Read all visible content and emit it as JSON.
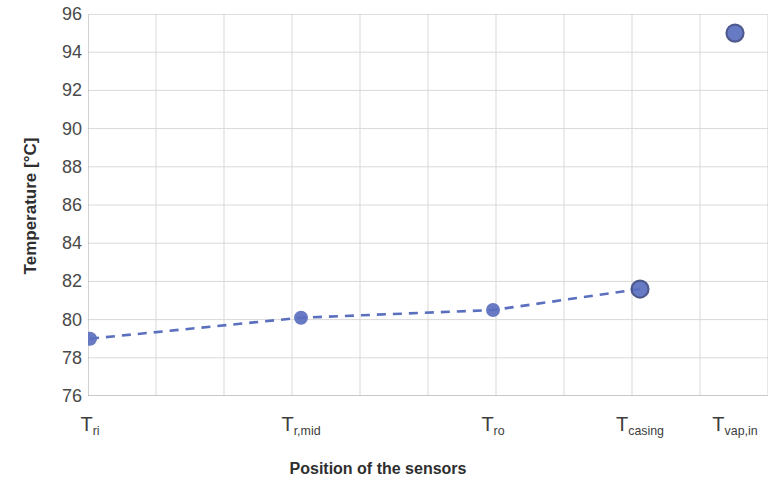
{
  "chart_data": {
    "type": "scatter",
    "title": "",
    "xlabel": "Position of the sensors",
    "ylabel": "Temperature [°C]",
    "categories": [
      "T_ri",
      "T_r,mid",
      "T_ro",
      "T_casing",
      "T_vap,in"
    ],
    "category_labels": [
      {
        "base": "T",
        "sub": "ri"
      },
      {
        "base": "T",
        "sub": "r,mid"
      },
      {
        "base": "T",
        "sub": "ro"
      },
      {
        "base": "T",
        "sub": "casing"
      },
      {
        "base": "T",
        "sub": "vap,in"
      }
    ],
    "values": [
      79.0,
      80.1,
      80.5,
      81.6,
      95.0
    ],
    "ylim": [
      76,
      96
    ],
    "yticks": [
      96,
      94,
      92,
      90,
      88,
      86,
      84,
      82,
      80,
      78,
      76
    ],
    "ytick_labels": [
      "96",
      "94",
      "92",
      "90",
      "88",
      "86",
      "84",
      "82",
      "80",
      "78",
      "76"
    ],
    "grid": true,
    "grid_color": "#d9d9d9",
    "axis_color": "#a6a6a6",
    "legend": "none",
    "series": [
      {
        "name": "Temperature",
        "marker": "circle",
        "marker_color": "#5b6fbf",
        "line_style": "dashed",
        "line_color": "#5b6fbf",
        "connected_points": 4,
        "values": [
          79.0,
          80.1,
          80.5,
          81.6,
          95.0
        ]
      }
    ]
  }
}
